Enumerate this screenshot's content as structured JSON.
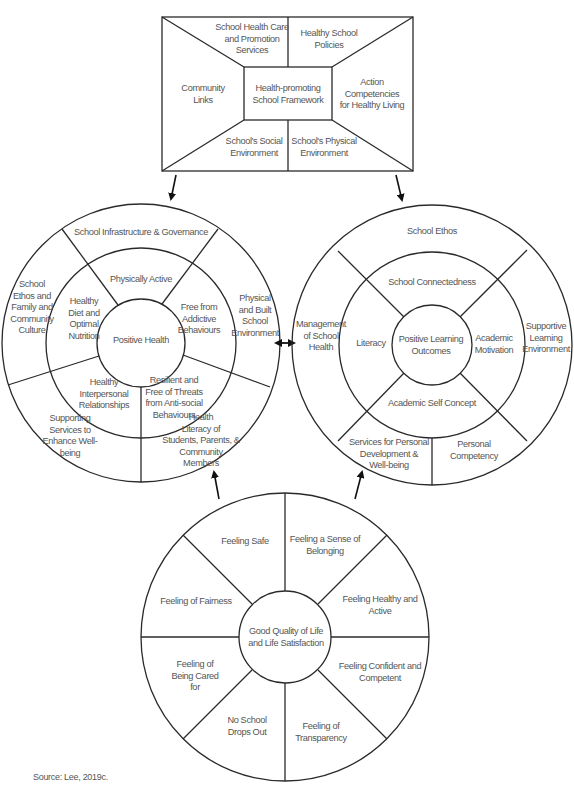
{
  "framework": {
    "center": "Health-promoting\nSchool Framework",
    "top_left": "School Health Care\nand Promotion\nServices",
    "top_right": "Healthy School\nPolicies",
    "left": "Community\nLinks",
    "right": "Action\nCompetencies\nfor Healthy Living",
    "bottom_left": "School's Social\nEnvironment",
    "bottom_right": "School's Physical\nEnvironment"
  },
  "left_wheel": {
    "center": "Positive Health",
    "middle_ring": {
      "top": "Physically Active",
      "left": "Healthy\nDiet and\nOptimal\nNutrition",
      "right": "Free from\nAddictive\nBehaviours",
      "lower_right": "Resilient and\nFree of Threats\nfrom Anti-social\nBehaviours",
      "lower_left": "Healthy\nInterpersonal\nRelationships"
    },
    "outer_ring": {
      "top": "School Infrastructure & Governance",
      "left": "School\nEthos and\nFamily and\nCommunity\nCulture",
      "right": "Physical\nand Built\nSchool\nEnvironment",
      "lower_right": "Health\nLiteracy of\nStudents, Parents, &\nCommunity\nMembers",
      "lower_left": "Supporting\nServices to\nEnhance Well-\nbeing"
    }
  },
  "right_wheel": {
    "center": "Positive Learning\nOutcomes",
    "middle_ring": {
      "top": "School Connectedness",
      "left": "Literacy",
      "right": "Academic\nMotivation",
      "bottom": "Academic Self Concept"
    },
    "outer_ring": {
      "top": "School Ethos",
      "left": "Management\nof School\nHealth",
      "right": "Supportive\nLearning\nEnvironment",
      "bottom_left": "Services for Personal\nDevelopment &\nWell-being",
      "bottom_right": "Personal\nCompetency"
    }
  },
  "bottom_wheel": {
    "center": "Good Quality of Life\nand Life Satisfaction",
    "segments": [
      "Feeling Safe",
      "Feeling a Sense of\nBelonging",
      "Feeling Healthy and\nActive",
      "Feeling Confident and\nCompetent",
      "Feeling of\nTransparency",
      "No School\nDrops Out",
      "Feeling of\nBeing Cared\nfor",
      "Feeling of Fairness"
    ]
  },
  "source": "Source: Lee, 2019c."
}
